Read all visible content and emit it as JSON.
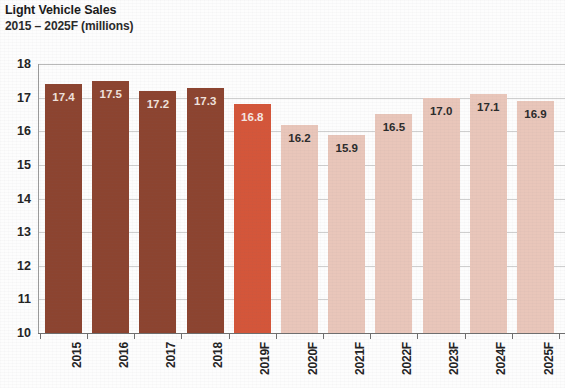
{
  "chart_data": {
    "type": "bar",
    "title": "Light Vehicle Sales",
    "subtitle": "2015 – 2025F (millions)",
    "xlabel": "",
    "ylabel": "",
    "ylim": [
      10,
      18
    ],
    "ytick_labels": [
      "18",
      "17",
      "16",
      "15",
      "14",
      "13",
      "12",
      "11",
      "10"
    ],
    "ytick_values": [
      18,
      17,
      16,
      15,
      14,
      13,
      12,
      11,
      10
    ],
    "grid": true,
    "legend": "none",
    "categories": [
      "2015",
      "2016",
      "2017",
      "2018",
      "2019F",
      "2020F",
      "2021F",
      "2022F",
      "2023F",
      "2024F",
      "2025F"
    ],
    "values": [
      17.4,
      17.5,
      17.2,
      17.3,
      16.8,
      16.2,
      15.9,
      16.5,
      17.0,
      17.1,
      16.9
    ],
    "value_labels": [
      "17.4",
      "17.5",
      "17.2",
      "17.3",
      "16.8",
      "16.2",
      "15.9",
      "16.5",
      "17.0",
      "17.1",
      "16.9"
    ],
    "bar_styles": [
      "dark",
      "dark",
      "dark",
      "dark",
      "mid",
      "light",
      "light",
      "light",
      "light",
      "light",
      "light"
    ],
    "colors": {
      "actual": "#8c4430",
      "current_forecast": "#d4563a",
      "forecast": "#e9c6ba",
      "gridline": "#cfcfcf",
      "axis": "#6e6e6e",
      "text": "#232323",
      "background": "#fdfdfd"
    }
  }
}
